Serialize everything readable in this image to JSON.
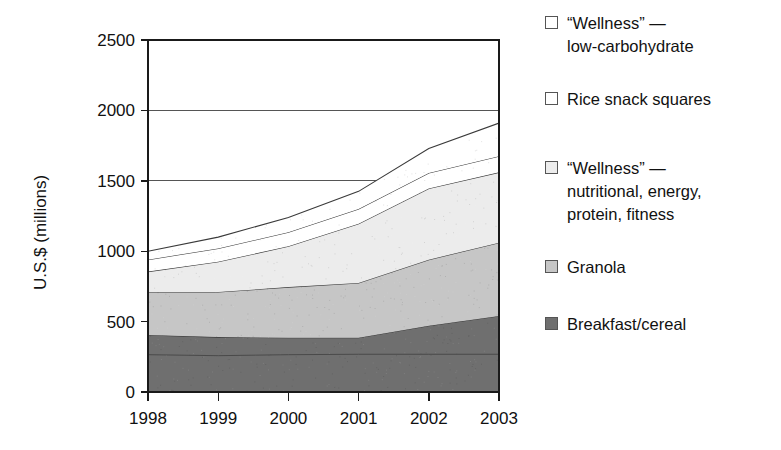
{
  "chart_data": {
    "type": "area",
    "title": "",
    "subtitle": "",
    "xlabel": "",
    "ylabel": "U.S.$ (millions)",
    "categories": [
      "1998",
      "1999",
      "2000",
      "2001",
      "2002",
      "2003"
    ],
    "x": [
      1998,
      1999,
      2000,
      2001,
      2002,
      2003
    ],
    "ylim": [
      0,
      2500
    ],
    "xlim": [
      1998,
      2003
    ],
    "yticks": [
      0,
      500,
      1000,
      1500,
      2000,
      2500
    ],
    "ytick_labels": [
      "0",
      "500",
      "1000",
      "1500",
      "2000",
      "2500"
    ],
    "xtick_labels": [
      "1998",
      "1999",
      "2000",
      "2001",
      "2002",
      "2003"
    ],
    "grid": true,
    "grid_axis": "y",
    "stacked": true,
    "legend_position": "right",
    "series": [
      {
        "name": "Breakfast/cereal",
        "color": "#6f6f6f",
        "values": [
          405,
          390,
          385,
          385,
          470,
          540
        ]
      },
      {
        "name": "Granola",
        "color": "#c6c6c6",
        "values": [
          305,
          320,
          360,
          390,
          470,
          520
        ]
      },
      {
        "name": "“Wellness” — nutritional, energy, protein, fitness",
        "color": "#ececec",
        "values": [
          145,
          215,
          290,
          420,
          505,
          500
        ]
      },
      {
        "name": "Rice snack squares",
        "color": "#ffffff",
        "values": [
          85,
          95,
          100,
          105,
          110,
          115
        ]
      },
      {
        "name": "“Wellness” — low-carbohydrate",
        "color": "#ffffff",
        "values": [
          60,
          80,
          105,
          125,
          175,
          235
        ]
      }
    ],
    "stack_tops": {
      "breakfast_cereal": [
        405,
        390,
        385,
        385,
        470,
        540
      ],
      "granola": [
        710,
        710,
        745,
        775,
        940,
        1060
      ],
      "wellness_nutritional": [
        855,
        925,
        1035,
        1195,
        1445,
        1560
      ],
      "rice_snack_squares": [
        940,
        1020,
        1135,
        1300,
        1555,
        1675
      ],
      "wellness_low_carb": [
        1000,
        1100,
        1240,
        1425,
        1730,
        1910
      ]
    },
    "inner_line_breakfast": [
      265,
      258,
      265,
      268,
      268,
      268
    ]
  },
  "legend": {
    "items": [
      {
        "label": "“Wellness” —\n  low-carbohydrate",
        "swatch": "#ffffff",
        "icon": "legend-swatch-icon"
      },
      {
        "label": "Rice snack squares",
        "swatch": "#ffffff",
        "icon": "legend-swatch-icon"
      },
      {
        "label": "“Wellness” —\n  nutritional, energy,\n  protein, fitness",
        "swatch": "#ececec",
        "icon": "legend-swatch-icon"
      },
      {
        "label": "Granola",
        "swatch": "#c6c6c6",
        "icon": "legend-swatch-icon"
      },
      {
        "label": "Breakfast/cereal",
        "swatch": "#6f6f6f",
        "icon": "legend-swatch-icon"
      }
    ]
  },
  "axes": {
    "y_title": "U.S.$ (millions)",
    "y_tick_0": "0",
    "y_tick_1": "500",
    "y_tick_2": "1000",
    "y_tick_3": "1500",
    "y_tick_4": "2000",
    "y_tick_5": "2500",
    "x_tick_0": "1998",
    "x_tick_1": "1999",
    "x_tick_2": "2000",
    "x_tick_3": "2001",
    "x_tick_4": "2002",
    "x_tick_5": "2003"
  },
  "colors": {
    "axis": "#1a1a1a",
    "grid": "#555555",
    "series_breakfast": "#6f6f6f",
    "series_granola": "#c6c6c6",
    "series_wellness_nutritional": "#ececec",
    "series_rice": "#ffffff",
    "series_wellness_lowcarb": "#ffffff"
  }
}
